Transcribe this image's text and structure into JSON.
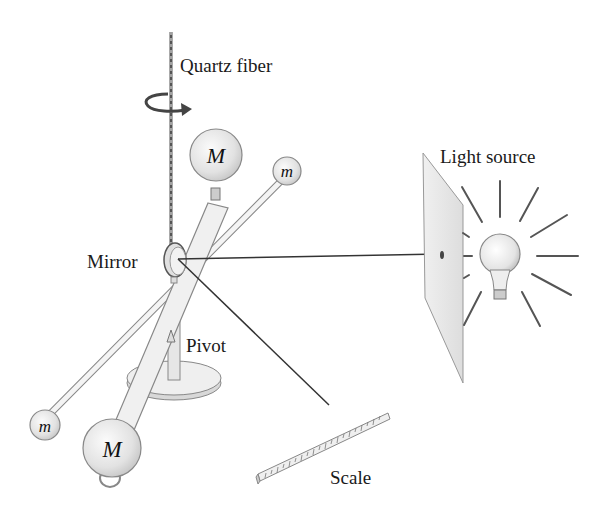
{
  "diagram": {
    "labels": {
      "quartz_fiber": "Quartz fiber",
      "mirror": "Mirror",
      "pivot": "Pivot",
      "scale": "Scale",
      "light_source": "Light source"
    },
    "masses": {
      "large_top": "M",
      "large_bottom": "M",
      "small_top": "m",
      "small_bottom": "m"
    },
    "icons": [
      "rotation-arrow-icon",
      "light-bulb-icon"
    ],
    "colors": {
      "line": "#333333",
      "sphere_fill": "#e6e6e6",
      "rod_fill": "#f0f0f0",
      "panel_fill": "#e9e9e9"
    }
  }
}
